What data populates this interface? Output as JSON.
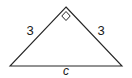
{
  "figure": {
    "kind": "right-triangle-diagram",
    "background_color": "#ffffff",
    "stroke_color": "#262626",
    "text_color": "#1a1a1a",
    "labels": {
      "leg_left": "3",
      "leg_right": "3",
      "hypotenuse": "c"
    },
    "right_angle_marker": {
      "name": "right-angle-square",
      "location": "apex"
    },
    "geometry": {
      "apex": [
        66,
        7
      ],
      "bottom_left": [
        10,
        66
      ],
      "bottom_right": [
        122,
        66
      ]
    }
  }
}
